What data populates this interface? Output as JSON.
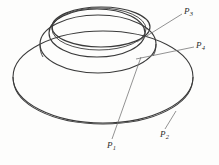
{
  "figure": {
    "kind": "line-drawing",
    "background_color": "#fdfdfc",
    "stroke_color": "#3a3a3a",
    "leader_color": "#6f6f6f",
    "label_color": "#2b2b2b",
    "width": 219,
    "height": 165
  },
  "labels": [
    {
      "id": "P1",
      "text": "P",
      "subscript": "1",
      "x": 107,
      "y": 141
    },
    {
      "id": "P2",
      "text": "P",
      "subscript": "2",
      "x": 160,
      "y": 130
    },
    {
      "id": "P3",
      "text": "P",
      "subscript": "3",
      "x": 184,
      "y": 7
    },
    {
      "id": "P4",
      "text": "P",
      "subscript": "4",
      "x": 196,
      "y": 41
    }
  ],
  "leaders": [
    {
      "id": "leader-P1",
      "from_x": 141,
      "from_y": 57,
      "to_x": 112,
      "to_y": 139
    },
    {
      "id": "leader-P2",
      "from_x": 176,
      "from_y": 111,
      "to_x": 165,
      "to_y": 129
    },
    {
      "id": "leader-P3",
      "from_x": 137,
      "from_y": 42,
      "to_x": 182,
      "to_y": 14
    },
    {
      "id": "leader-P4",
      "from_x": 136,
      "from_y": 59,
      "to_x": 194,
      "to_y": 47
    }
  ],
  "curves": {
    "outer_disk_top": "outer ellipse upper boundary of flat torus disk",
    "outer_disk_bottom": "outer ellipse lower boundary giving disk thickness",
    "hole_rim_outer": "medium ellipse forming outer edge of raised hole rim",
    "hole_rim_inner": "ellipse forming inner wall of raised hole rim",
    "top_rim_ellipse": "upper ellipse of the raised collar",
    "top_rim_ellipse_second": "second overlapping ellipse of the raised collar"
  }
}
